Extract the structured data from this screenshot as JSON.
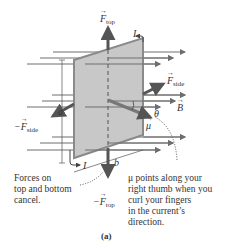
{
  "figure": {
    "label": "(a)",
    "labels": {
      "f_top": {
        "symbol": "F",
        "sub": "top"
      },
      "neg_f_top": {
        "prefix": "−",
        "symbol": "F",
        "sub": "top"
      },
      "f_side": {
        "symbol": "F",
        "sub": "side"
      },
      "neg_f_side": {
        "prefix": "−",
        "symbol": "F",
        "sub": "side"
      },
      "current_top": "I",
      "current_bottom": "I",
      "b_field": "B",
      "theta": "θ",
      "mu": "μ",
      "dim_a": "a",
      "dim_b": "b"
    },
    "captions": {
      "left": [
        "Forces on",
        "top and bottom",
        "cancel."
      ],
      "right": [
        "μ points along your",
        "right thumb when you",
        "curl your fingers",
        "in the current’s",
        "direction."
      ]
    },
    "colors": {
      "plate_fill": "#c8c8c8",
      "plate_edge": "#8a8a8a",
      "field_line": "#6e6e6e",
      "force_arrow": "#555555"
    }
  }
}
